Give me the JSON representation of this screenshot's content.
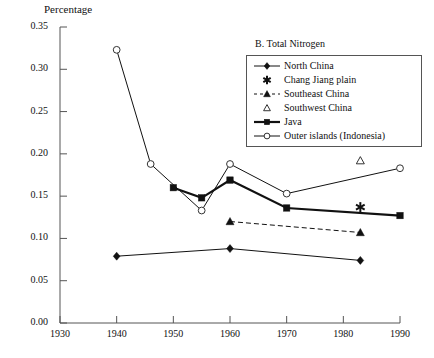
{
  "chart_data": {
    "type": "line",
    "title": "B. Total Nitrogen",
    "ylabel": "Percentage",
    "xlabel": "",
    "xlim": [
      1930,
      1990
    ],
    "ylim": [
      0.0,
      0.35
    ],
    "grid": false,
    "legend_position": "upper-right-inside",
    "xticks": [
      "1930",
      "1940",
      "1950",
      "1960",
      "1970",
      "1980",
      "1990"
    ],
    "yticks": [
      "0.00",
      "0.05",
      "0.10",
      "0.15",
      "0.20",
      "0.25",
      "0.30",
      "0.35"
    ],
    "series": [
      {
        "name": "North China",
        "marker": "filled-diamond",
        "line": "solid-thin",
        "points": [
          {
            "x": 1940,
            "y": 0.079
          },
          {
            "x": 1960,
            "y": 0.088
          },
          {
            "x": 1983,
            "y": 0.074
          }
        ]
      },
      {
        "name": "Chang Jiang plain",
        "marker": "asterisk",
        "line": "none",
        "points": [
          {
            "x": 1983,
            "y": 0.137
          }
        ]
      },
      {
        "name": "Southeast China",
        "marker": "filled-triangle",
        "line": "dashed",
        "points": [
          {
            "x": 1960,
            "y": 0.12
          },
          {
            "x": 1983,
            "y": 0.107
          }
        ]
      },
      {
        "name": "Southwest China",
        "marker": "open-triangle",
        "line": "none",
        "points": [
          {
            "x": 1983,
            "y": 0.192
          }
        ]
      },
      {
        "name": "Java",
        "marker": "filled-square",
        "line": "solid-thick",
        "points": [
          {
            "x": 1950,
            "y": 0.16
          },
          {
            "x": 1955,
            "y": 0.148
          },
          {
            "x": 1960,
            "y": 0.169
          },
          {
            "x": 1970,
            "y": 0.136
          },
          {
            "x": 1990,
            "y": 0.127
          }
        ]
      },
      {
        "name": "Outer islands (Indonesia)",
        "marker": "open-circle",
        "line": "solid-thin",
        "points": [
          {
            "x": 1940,
            "y": 0.323
          },
          {
            "x": 1946,
            "y": 0.188
          },
          {
            "x": 1955,
            "y": 0.133
          },
          {
            "x": 1960,
            "y": 0.188
          },
          {
            "x": 1970,
            "y": 0.153
          },
          {
            "x": 1990,
            "y": 0.183
          }
        ]
      }
    ]
  },
  "legend": {
    "items": [
      {
        "label": "North China",
        "key": "filled-diamond-line-key"
      },
      {
        "label": "Chang Jiang plain",
        "key": "asterisk-key"
      },
      {
        "label": "Southeast China",
        "key": "filled-triangle-dashed-key"
      },
      {
        "label": "Southwest China",
        "key": "open-triangle-key"
      },
      {
        "label": "Java",
        "key": "filled-square-thick-line-key"
      },
      {
        "label": "Outer islands (Indonesia)",
        "key": "open-circle-line-key"
      }
    ]
  },
  "axes": {
    "ylabel": "Percentage",
    "yticks": [
      "0.35",
      "0.30",
      "0.25",
      "0.20",
      "0.15",
      "0.10",
      "0.05",
      "0.00"
    ],
    "xticks": [
      "1930",
      "1940",
      "1950",
      "1960",
      "1970",
      "1980",
      "1990"
    ]
  },
  "panel": {
    "title": "B. Total Nitrogen"
  },
  "colors": {
    "ink": "#111111",
    "axis": "#555555",
    "background": "#ffffff"
  }
}
